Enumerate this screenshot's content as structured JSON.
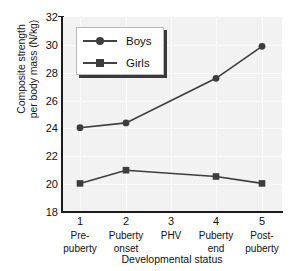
{
  "chart_data": {
    "type": "line",
    "title": "",
    "xlabel": "Developmental status",
    "ylabel": "Composite strength per body mass (N/kg)",
    "ylabel_lines": [
      "Composite strength",
      "per body mass (N/kg)"
    ],
    "x": [
      1,
      2,
      3,
      4,
      5
    ],
    "categories": [
      "Pre-puberty",
      "Puberty onset",
      "PHV",
      "Puberty end",
      "Post-puberty"
    ],
    "category_lines": [
      [
        "Pre-",
        "puberty"
      ],
      [
        "Puberty",
        "onset"
      ],
      [
        "PHV"
      ],
      [
        "Puberty",
        "end"
      ],
      [
        "Post-",
        "puberty"
      ]
    ],
    "xtick_labels": [
      "1",
      "2",
      "3",
      "4",
      "5"
    ],
    "ytick_labels": [
      "18",
      "20",
      "22",
      "24",
      "26",
      "28",
      "30",
      "32"
    ],
    "yticks": [
      18,
      20,
      22,
      24,
      26,
      28,
      30,
      32
    ],
    "ylim": [
      18,
      32
    ],
    "xlim": [
      0.5,
      5.5
    ],
    "grid": true,
    "legend_position": "upper left",
    "series": [
      {
        "name": "Boys",
        "marker": "circle",
        "color": "#3d3d3d",
        "x": [
          1,
          2,
          4,
          5
        ],
        "values": [
          24.05,
          24.4,
          27.6,
          29.9
        ]
      },
      {
        "name": "Girls",
        "marker": "square",
        "color": "#3d3d3d",
        "x": [
          1,
          2,
          4,
          5
        ],
        "values": [
          20.05,
          21.0,
          20.55,
          20.05
        ]
      }
    ]
  },
  "legend": {
    "entries": [
      {
        "label": "Boys",
        "marker": "circle-marker"
      },
      {
        "label": "Girls",
        "marker": "square-marker"
      }
    ]
  },
  "axes": {
    "x_title": "Developmental status",
    "y_title_line1": "Composite strength",
    "y_title_line2": "per body mass (N/kg)"
  },
  "colors": {
    "plot_background": "#f2f2f2",
    "axis": "#1c1c1c",
    "series": "#3d3d3d",
    "gridline": "#fbfbfb",
    "legend_shadow": "#3a3a3a"
  }
}
